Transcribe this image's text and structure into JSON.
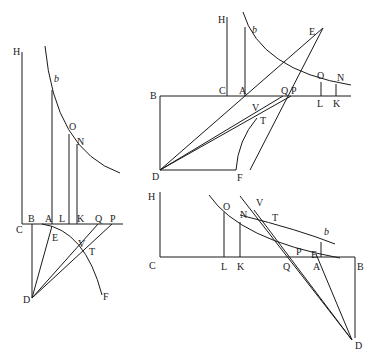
{
  "figures": [
    {
      "id": "left",
      "labels": {
        "H": "H",
        "b": "b",
        "O": "O",
        "N": "N",
        "C": "C",
        "B": "B",
        "A": "A",
        "L": "L",
        "K": "K",
        "Q": "Q",
        "P": "P",
        "E": "E",
        "V": "V",
        "T": "T",
        "D": "D",
        "F": "F"
      }
    },
    {
      "id": "top-right",
      "labels": {
        "H": "H",
        "b": "b",
        "E": "E",
        "O": "O",
        "N": "N",
        "B": "B",
        "C": "C",
        "A": "A",
        "Q": "Q",
        "P": "P",
        "L": "L",
        "K": "K",
        "V": "V",
        "T": "T",
        "D": "D",
        "F": "F"
      }
    },
    {
      "id": "bottom-right",
      "labels": {
        "H": "H",
        "O": "O",
        "N": "N",
        "V": "V",
        "T": "T",
        "b": "b",
        "P": "P",
        "E": "E",
        "C": "C",
        "L": "L",
        "K": "K",
        "Q": "Q",
        "A": "A",
        "B": "B",
        "D": "D"
      }
    }
  ]
}
